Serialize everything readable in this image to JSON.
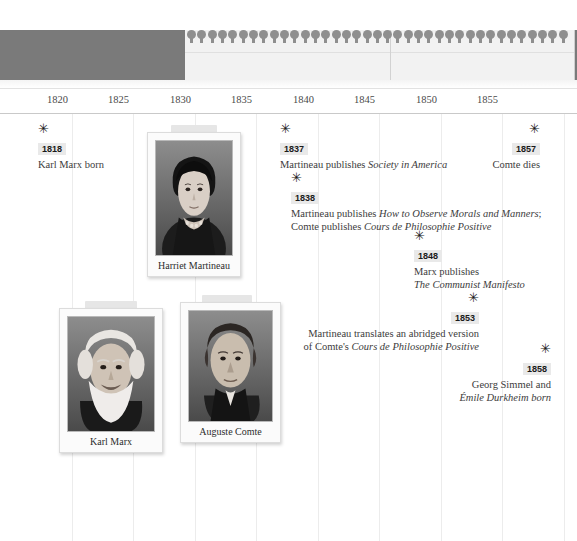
{
  "overview": {
    "viewport_left": 185,
    "viewport_width": 390,
    "split_offset": 205,
    "pin_count": 37,
    "pin_icon": "map-pin-marker",
    "band_color": "#7a7a7a",
    "viewport_color": "#f2f2f2"
  },
  "axis": {
    "label": "Years",
    "ticks": [
      {
        "label": "1820",
        "x": 72
      },
      {
        "label": "1825",
        "x": 133
      },
      {
        "label": "1830",
        "x": 195
      },
      {
        "label": "1835",
        "x": 256
      },
      {
        "label": "1840",
        "x": 318
      },
      {
        "label": "1845",
        "x": 379
      },
      {
        "label": "1850",
        "x": 441
      },
      {
        "label": "1855",
        "x": 502
      }
    ],
    "gridline_x": [
      72,
      133,
      195,
      256,
      318,
      379,
      441,
      502,
      564
    ]
  },
  "events": [
    {
      "id": "marx-born",
      "year": "1818",
      "marker_icon": "star-asterisk-icon",
      "align": "left",
      "x": 38,
      "y": 8,
      "lines": [
        [
          {
            "t": "Karl Marx born",
            "i": false
          }
        ]
      ]
    },
    {
      "id": "society-in-america",
      "year": "1837",
      "marker_icon": "star-asterisk-icon",
      "align": "left",
      "x": 280,
      "y": 8,
      "lines": [
        [
          {
            "t": "Martineau publishes ",
            "i": false
          },
          {
            "t": "Society in America",
            "i": true
          }
        ]
      ]
    },
    {
      "id": "comte-dies",
      "year": "1857",
      "marker_icon": "star-asterisk-icon",
      "align": "right",
      "x": 540,
      "y": 8,
      "lines": [
        [
          {
            "t": "Comte dies",
            "i": false
          }
        ]
      ]
    },
    {
      "id": "observe-morals-and-cours",
      "year": "1838",
      "marker_icon": "star-asterisk-icon",
      "align": "left",
      "x": 291,
      "y": 57,
      "lines": [
        [
          {
            "t": "Martineau publishes ",
            "i": false
          },
          {
            "t": "How to Observe Morals and Manners",
            "i": true
          },
          {
            "t": ";",
            "i": false
          }
        ],
        [
          {
            "t": "Comte publishes ",
            "i": false
          },
          {
            "t": "Cours de Philosophie Positive",
            "i": true
          }
        ]
      ]
    },
    {
      "id": "communist-manifesto",
      "year": "1848",
      "marker_icon": "star-asterisk-icon",
      "align": "left",
      "x": 414,
      "y": 115,
      "lines": [
        [
          {
            "t": "Marx publishes",
            "i": false
          }
        ],
        [
          {
            "t": "The Communist Manifesto",
            "i": true
          }
        ]
      ]
    },
    {
      "id": "martineau-translates-cours",
      "year": "1853",
      "marker_icon": "star-asterisk-icon",
      "align": "right",
      "x": 479,
      "y": 177,
      "lines": [
        [
          {
            "t": "Martineau translates an abridged version",
            "i": false
          }
        ],
        [
          {
            "t": "of Comte's ",
            "i": false
          },
          {
            "t": "Cours de Philosophie Positive",
            "i": true
          }
        ]
      ]
    },
    {
      "id": "simmel-durkheim-born",
      "year": "1858",
      "marker_icon": "star-asterisk-icon",
      "align": "right",
      "x": 551,
      "y": 228,
      "lines": [
        [
          {
            "t": "Georg Simmel and",
            "i": false
          }
        ],
        [
          {
            "t": "Émile Durkheim born",
            "i": true
          }
        ]
      ]
    }
  ],
  "cards": [
    {
      "id": "harriet-martineau",
      "caption": "Harriet Martineau",
      "x": 147,
      "y": 11,
      "w": 94,
      "photo_h": 116,
      "tab_x": 24,
      "tab_w": 46,
      "portrait": "harriet-martineau-portrait"
    },
    {
      "id": "karl-marx",
      "caption": "Karl Marx",
      "x": 59,
      "y": 187,
      "w": 104,
      "photo_h": 116,
      "tab_x": 26,
      "tab_w": 52,
      "portrait": "karl-marx-portrait"
    },
    {
      "id": "auguste-comte",
      "caption": "Auguste Comte",
      "x": 180,
      "y": 181,
      "w": 101,
      "photo_h": 112,
      "tab_x": 22,
      "tab_w": 50,
      "portrait": "auguste-comte-portrait"
    }
  ],
  "colors": {
    "year_badge_bg": "#e9e9e9",
    "gridline": "#ececec",
    "text": "#3c3c3c",
    "overview_band": "#7a7a7a"
  }
}
